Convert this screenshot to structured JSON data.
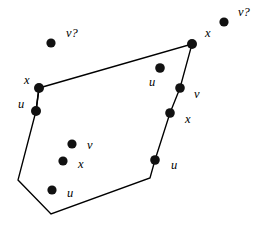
{
  "figure": {
    "background_color": "#ffffff",
    "stroke_color": "#000000",
    "dot_color": "#111111",
    "width": 263,
    "height": 225,
    "polygon": {
      "name": "convex-region-outline",
      "closed": true,
      "vertices": [
        {
          "x": 39,
          "y": 88
        },
        {
          "x": 192,
          "y": 44
        },
        {
          "x": 180,
          "y": 88
        },
        {
          "x": 170,
          "y": 113
        },
        {
          "x": 155,
          "y": 160
        },
        {
          "x": 150,
          "y": 178
        },
        {
          "x": 51,
          "y": 214
        },
        {
          "x": 18,
          "y": 180
        },
        {
          "x": 36,
          "y": 111
        }
      ]
    },
    "spurs": [
      {
        "name": "spur-x-to-u-left",
        "x1": 39,
        "y1": 88,
        "x2": 36,
        "y2": 111
      }
    ],
    "points": [
      {
        "id": "p1",
        "label": "v?",
        "cx": 51,
        "cy": 43,
        "r": 4.6,
        "lx": 66,
        "ly": 34,
        "role": "outside"
      },
      {
        "id": "p2",
        "label": "v?",
        "cx": 224,
        "cy": 22,
        "r": 4.6,
        "lx": 238,
        "ly": 13,
        "role": "outside"
      },
      {
        "id": "p3",
        "label": "x",
        "cx": 192,
        "cy": 44,
        "r": 5.0,
        "lx": 205,
        "ly": 34,
        "role": "vertex"
      },
      {
        "id": "p4",
        "label": "x",
        "cx": 39,
        "cy": 88,
        "r": 5.0,
        "lx": 24,
        "ly": 81,
        "role": "vertex"
      },
      {
        "id": "p5",
        "label": "u",
        "cx": 36,
        "cy": 111,
        "r": 5.0,
        "lx": 18,
        "ly": 105,
        "role": "vertex"
      },
      {
        "id": "p6",
        "label": "u",
        "cx": 160,
        "cy": 68,
        "r": 4.8,
        "lx": 149,
        "ly": 83,
        "role": "interior"
      },
      {
        "id": "p7",
        "label": "v",
        "cx": 180,
        "cy": 88,
        "r": 4.8,
        "lx": 194,
        "ly": 95,
        "role": "vertex"
      },
      {
        "id": "p8",
        "label": "x",
        "cx": 170,
        "cy": 113,
        "r": 4.8,
        "lx": 185,
        "ly": 120,
        "role": "vertex"
      },
      {
        "id": "p9",
        "label": "u",
        "cx": 155,
        "cy": 160,
        "r": 4.8,
        "lx": 171,
        "ly": 166,
        "role": "vertex"
      },
      {
        "id": "p10",
        "label": "v",
        "cx": 72,
        "cy": 144,
        "r": 4.6,
        "lx": 87,
        "ly": 146,
        "role": "interior"
      },
      {
        "id": "p11",
        "label": "x",
        "cx": 63,
        "cy": 161,
        "r": 4.6,
        "lx": 78,
        "ly": 165,
        "role": "interior"
      },
      {
        "id": "p12",
        "label": "u",
        "cx": 52,
        "cy": 190,
        "r": 4.6,
        "lx": 67,
        "ly": 194,
        "role": "interior"
      }
    ]
  }
}
